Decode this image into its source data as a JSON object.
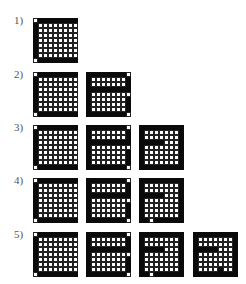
{
  "diagram": {
    "rows": [
      {
        "label": "1)",
        "grids": [
          "A"
        ]
      },
      {
        "label": "2)",
        "grids": [
          "A",
          "B"
        ]
      },
      {
        "label": "3)",
        "grids": [
          "A",
          "B",
          "C"
        ]
      },
      {
        "label": "4)",
        "grids": [
          "A",
          "B",
          "D"
        ]
      },
      {
        "label": "5)",
        "grids": [
          "A",
          "B",
          "D",
          "E"
        ]
      }
    ],
    "colors": {
      "black": "#0a0a0a",
      "white": "#ffffff",
      "line": "#222222"
    },
    "grid_size": 9,
    "patterns": {
      "A": [
        "011111111",
        "100000000",
        "100000000",
        "100000000",
        "100000000",
        "100000000",
        "100000000",
        "100000000",
        "011111111"
      ],
      "B": [
        "111111110",
        "100000001",
        "100000001",
        "111111111",
        "100000000",
        "100000001",
        "100000001",
        "100000001",
        "111111110"
      ],
      "C": [
        "111111111",
        "100000001",
        "100000001",
        "111110001",
        "100000001",
        "100000001",
        "100000001",
        "100000001",
        "111111111"
      ],
      "D": [
        "111111111",
        "100000001",
        "100000001",
        "111110001",
        "100000001",
        "100000001",
        "100000001",
        "100000001",
        "110111111"
      ],
      "E": [
        "111111111",
        "100000001",
        "100000001",
        "111110001",
        "100000001",
        "100000001",
        "100000001",
        "100001001",
        "111111111"
      ]
    }
  }
}
